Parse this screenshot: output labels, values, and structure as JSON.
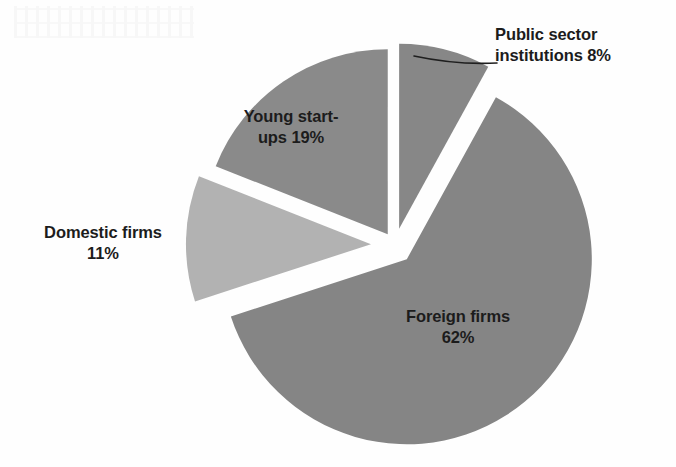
{
  "figure": {
    "background_color": "#fefefe",
    "center_x": 395,
    "center_y": 245,
    "radius": 185
  },
  "chart_data": {
    "type": "pie",
    "title": "",
    "subtitle": "",
    "xlabel": "",
    "ylabel": "",
    "grid": false,
    "legend_position": "none",
    "label_format": "name + percent",
    "exploded": true,
    "start_angle_deg": 0,
    "direction": "clockwise",
    "categories": [
      "Public sector institutions",
      "Foreign firms",
      "Domestic firms",
      "Young start-ups"
    ],
    "values": [
      8,
      62,
      11,
      19
    ],
    "units": "percent",
    "total": 100,
    "slices": [
      {
        "name": "Public sector institutions",
        "value": 8,
        "percent_label": "8%",
        "label_text": "Public sector institutions 8%",
        "label_line1": "Public sector",
        "label_line2": "institutions 8%",
        "color": "#878787",
        "start_angle_deg": 0,
        "end_angle_deg": 28.8,
        "explode": 0.09,
        "has_leader_line": true,
        "label_placement": "outside-right"
      },
      {
        "name": "Foreign firms",
        "value": 62,
        "percent_label": "62%",
        "label_text": "Foreign firms 62%",
        "label_line1": "Foreign firms",
        "label_line2": "62%",
        "color": "#858585",
        "start_angle_deg": 28.8,
        "end_angle_deg": 252.0,
        "explode": 0.1,
        "has_leader_line": false,
        "label_placement": "inside"
      },
      {
        "name": "Domestic firms",
        "value": 11,
        "percent_label": "11%",
        "label_text": "Domestic firms 11%",
        "label_line1": "Domestic firms",
        "label_line2": "11%",
        "color": "#b2b2b2",
        "start_angle_deg": 252.0,
        "end_angle_deg": 291.6,
        "explode": 0.13,
        "has_leader_line": false,
        "label_placement": "outside-left"
      },
      {
        "name": "Young start-ups",
        "value": 19,
        "percent_label": "19%",
        "label_text": "Young start-ups 19%",
        "label_line1": "Young start-",
        "label_line2": "ups 19%",
        "color": "#8a8a8a",
        "start_angle_deg": 291.6,
        "end_angle_deg": 360.0,
        "explode": 0.07,
        "has_leader_line": false,
        "label_placement": "inside"
      }
    ],
    "colors": [
      "#878787",
      "#858585",
      "#b2b2b2",
      "#8a8a8a"
    ]
  },
  "leader_line": {
    "color": "#1f1f1f",
    "width": 1.6,
    "from_x": 414,
    "from_y": 56,
    "to_x": 497,
    "to_y": 63
  }
}
